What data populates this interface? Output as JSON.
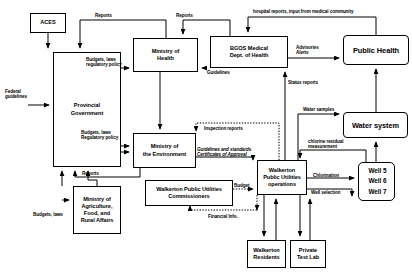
{
  "diagram": {
    "type": "flowchart",
    "nodes": [
      {
        "id": "aces",
        "label": "ACES",
        "x": 30,
        "y": 13,
        "w": 36,
        "h": 20,
        "style": "plain"
      },
      {
        "id": "provgov",
        "label": "Provincial\nGovernment",
        "x": 53,
        "y": 52,
        "w": 68,
        "h": 115,
        "style": "plain"
      },
      {
        "id": "moh",
        "label": "Ministry of\nHealth",
        "x": 133,
        "y": 38,
        "w": 65,
        "h": 34,
        "style": "plain"
      },
      {
        "id": "bgos",
        "label": "BGOS Medical\nDept. of Health",
        "x": 210,
        "y": 36,
        "w": 78,
        "h": 32,
        "style": "plain"
      },
      {
        "id": "publichealth",
        "label": "Public Health",
        "x": 343,
        "y": 35,
        "w": 66,
        "h": 30,
        "style": "bold"
      },
      {
        "id": "moe",
        "label": "Ministry of\nthe Environment",
        "x": 133,
        "y": 133,
        "w": 63,
        "h": 35,
        "style": "plain"
      },
      {
        "id": "moa",
        "label": "Ministry of\nAgriculture,\nFood, and\nRural Affairs",
        "x": 73,
        "y": 186,
        "w": 48,
        "h": 48,
        "style": "plain"
      },
      {
        "id": "wpucomm",
        "label": "Walkerton Public Utilities\nCommissioners",
        "x": 145,
        "y": 180,
        "w": 88,
        "h": 26,
        "style": "plain"
      },
      {
        "id": "wpuops",
        "label": "Walkerton\nPublic Utilities\noperations",
        "x": 257,
        "y": 160,
        "w": 50,
        "h": 35,
        "style": "plain"
      },
      {
        "id": "watersystem",
        "label": "Water system",
        "x": 343,
        "y": 112,
        "w": 65,
        "h": 26,
        "style": "bold"
      },
      {
        "id": "wells",
        "label": "Well 5\nWell 6\nWell 7",
        "x": 358,
        "y": 162,
        "w": 37,
        "h": 39,
        "style": "wells"
      },
      {
        "id": "residents",
        "label": "Walkerton\nResidents",
        "x": 247,
        "y": 240,
        "w": 39,
        "h": 28,
        "style": "plain"
      },
      {
        "id": "testlab",
        "label": "Private\nTest Lab",
        "x": 290,
        "y": 240,
        "w": 36,
        "h": 28,
        "style": "plain"
      }
    ],
    "edge_labels": [
      {
        "id": "reports-moh",
        "text": "Reports",
        "x": 95,
        "y": 13,
        "align": "left"
      },
      {
        "id": "reports-bgos",
        "text": "Reports",
        "x": 176,
        "y": 13,
        "align": "left"
      },
      {
        "id": "hospital-reports",
        "text": "hospital reports, input from medical community",
        "x": 253,
        "y": 9,
        "align": "left"
      },
      {
        "id": "budgets-laws-moh",
        "text": "Budgets, laws\nregulatory policy",
        "x": 86,
        "y": 57,
        "align": "left"
      },
      {
        "id": "federal-guidelines",
        "text": "Federal\nguidelines",
        "x": 7,
        "y": 89,
        "align": "left"
      },
      {
        "id": "guidelines-moh",
        "text": "Guidelines",
        "x": 201,
        "y": 68,
        "align": "left"
      },
      {
        "id": "advisories-alerts",
        "text": "Advisories\nAlerts",
        "x": 296,
        "y": 45,
        "align": "left"
      },
      {
        "id": "status-reports",
        "text": "Status reports",
        "x": 290,
        "y": 80,
        "align": "left"
      },
      {
        "id": "water-samples",
        "text": "Water samples",
        "x": 301,
        "y": 109,
        "align": "left"
      },
      {
        "id": "budgets-laws-moe",
        "text": "Budgets, laws\nRegulatory policy",
        "x": 81,
        "y": 130,
        "align": "left"
      },
      {
        "id": "inspection-reports",
        "text": "Inspection reports",
        "x": 198,
        "y": 127,
        "align": "left"
      },
      {
        "id": "guidelines-std",
        "text": "Guidelines and standards\nCertificates of Approval",
        "x": 198,
        "y": 148,
        "align": "left"
      },
      {
        "id": "chlorine-residual",
        "text": "chlorine residual\nmeasurement",
        "x": 308,
        "y": 141,
        "align": "left"
      },
      {
        "id": "reports-moa",
        "text": "Reports",
        "x": 82,
        "y": 172,
        "align": "left"
      },
      {
        "id": "budget-wpu",
        "text": "Budget",
        "x": 236,
        "y": 184,
        "align": "left"
      },
      {
        "id": "chlorination",
        "text": "Chlorination",
        "x": 317,
        "y": 179,
        "align": "left"
      },
      {
        "id": "well-selection",
        "text": "Well selection",
        "x": 312,
        "y": 190,
        "align": "left"
      },
      {
        "id": "budgets-laws-moa",
        "text": "Budgets, laws",
        "x": 36,
        "y": 212,
        "align": "left"
      },
      {
        "id": "financial-info",
        "text": "Financial Info.",
        "x": 210,
        "y": 222,
        "align": "left"
      }
    ],
    "colors": {
      "stroke": "#000000",
      "background": "#ffffff"
    }
  }
}
